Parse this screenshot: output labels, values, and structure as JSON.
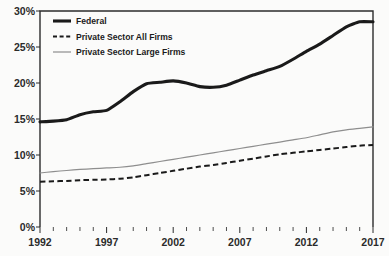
{
  "chart_data": {
    "type": "line",
    "title": "",
    "subtitle": "",
    "xlabel": "",
    "ylabel": "",
    "xlim": [
      1992,
      2017
    ],
    "ylim": [
      0,
      30
    ],
    "grid": false,
    "legend_position": "top-left",
    "y_ticks": [
      "0%",
      "5%",
      "10%",
      "15%",
      "20%",
      "25%",
      "30%"
    ],
    "y_tick_values": [
      0,
      5,
      10,
      15,
      20,
      25,
      30
    ],
    "x_ticks": [
      "1992",
      "1997",
      "2002",
      "2007",
      "2012",
      "2017"
    ],
    "x_tick_values": [
      1992,
      1997,
      2002,
      2007,
      2012,
      2017
    ],
    "x": [
      1992,
      1993,
      1994,
      1995,
      1996,
      1997,
      1998,
      1999,
      2000,
      2001,
      2002,
      2003,
      2004,
      2005,
      2006,
      2007,
      2008,
      2009,
      2010,
      2011,
      2012,
      2013,
      2014,
      2015,
      2016,
      2017
    ],
    "series": [
      {
        "name": "Federal",
        "style": "solid-thick",
        "color": "#1a1a1a",
        "values": [
          14.6,
          14.7,
          14.9,
          15.6,
          16.0,
          16.2,
          17.4,
          18.8,
          19.9,
          20.1,
          20.3,
          20.0,
          19.5,
          19.4,
          19.7,
          20.4,
          21.1,
          21.7,
          22.3,
          23.3,
          24.4,
          25.4,
          26.6,
          27.8,
          28.5,
          28.5
        ]
      },
      {
        "name": "Private Sector All Firms",
        "style": "dashed",
        "color": "#1a1a1a",
        "values": [
          6.3,
          6.35,
          6.4,
          6.5,
          6.55,
          6.6,
          6.7,
          6.9,
          7.2,
          7.5,
          7.8,
          8.1,
          8.4,
          8.6,
          8.9,
          9.2,
          9.5,
          9.8,
          10.1,
          10.3,
          10.5,
          10.7,
          10.9,
          11.1,
          11.3,
          11.4
        ]
      },
      {
        "name": "Private Sector Large Firms",
        "style": "solid-thin-gray",
        "color": "#8e8e8e",
        "values": [
          7.5,
          7.7,
          7.85,
          8.0,
          8.1,
          8.2,
          8.3,
          8.5,
          8.8,
          9.1,
          9.4,
          9.7,
          10.0,
          10.3,
          10.6,
          10.9,
          11.2,
          11.5,
          11.8,
          12.1,
          12.4,
          12.8,
          13.2,
          13.5,
          13.7,
          13.9
        ]
      }
    ],
    "legend": [
      {
        "label": "Federal",
        "marker": "thick-solid-line"
      },
      {
        "label": "Private Sector All Firms",
        "marker": "dashed-line"
      },
      {
        "label": "Private Sector Large Firms",
        "marker": "thin-gray-line"
      }
    ]
  },
  "colors": {
    "federal": "#1a1a1a",
    "all_firms": "#1a1a1a",
    "large_firms": "#8e8e8e",
    "axis": "#2c2c2c",
    "background": "#fbfbfa"
  }
}
